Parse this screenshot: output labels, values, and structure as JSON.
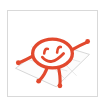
{
  "thumbnail": {
    "title": "Smiley figure on ground plane",
    "card_background": "#ffffff",
    "card_border_color": "#d9d9d9",
    "page_background": "#ffffff"
  },
  "ground_plane": {
    "label": "perspective ground plane",
    "stroke_color": "#cfcfcf",
    "fill_color": "#fcfcfc",
    "grid_stroke_color": "#dcdcdc",
    "outline_points": "8,60 46,33 86,46 52,80",
    "grid_lines": [
      "22,50 62,63",
      "36,41 76,54",
      "26,36 62,72",
      "38,37 72,70"
    ]
  },
  "figure": {
    "label": "smiley character sketch",
    "stroke_color": "#e2492e",
    "accent_color": "#e8624a",
    "head": {
      "cx": 48,
      "cy": 45,
      "rx": 21,
      "ry": 15
    },
    "eye_left": {
      "cx": 41,
      "cy": 42
    },
    "eye_right": {
      "cx": 55,
      "cy": 40
    },
    "smile_path": "M 38,50 Q 47,60 59,47",
    "arm_left_path": "M 27,47 Q 18,52 12,55",
    "arm_right_path": "M 69,43 Q 78,38 84,35",
    "leg_left_path": "M 43,59 Q 40,68 35,74",
    "leg_right_path": "M 55,59 Q 57,70 56,78",
    "hand_left": {
      "cx": 13,
      "cy": 55
    },
    "hand_right": {
      "cx": 83,
      "cy": 35
    },
    "foot_left": {
      "cx": 35,
      "cy": 75
    },
    "foot_right": {
      "cx": 56,
      "cy": 79
    }
  }
}
